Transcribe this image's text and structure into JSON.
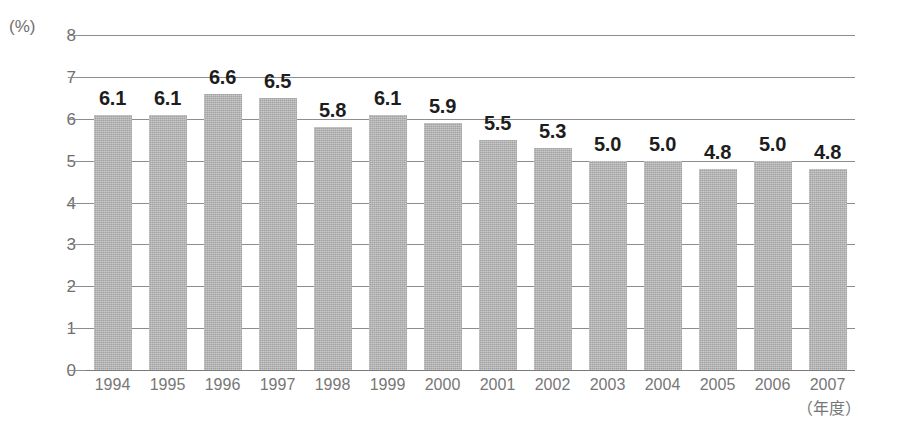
{
  "chart_data": {
    "type": "bar",
    "title": "",
    "subtitle": "",
    "xlabel": "（年度）",
    "ylabel": "(%)",
    "ylim": [
      0,
      8
    ],
    "ytick_step": 1,
    "grid": true,
    "legend": "none",
    "bar_color": "#b3b3b3",
    "label_color": "#1d1d1d",
    "axis_text_color": "#777777",
    "gridline_color": "#8d8d8d",
    "background": "#ffffff",
    "categories": [
      "1994",
      "1995",
      "1996",
      "1997",
      "1998",
      "1999",
      "2000",
      "2001",
      "2002",
      "2003",
      "2004",
      "2005",
      "2006",
      "2007"
    ],
    "values": [
      6.1,
      6.1,
      6.6,
      6.5,
      5.8,
      6.1,
      5.9,
      5.5,
      5.3,
      5.0,
      5.0,
      4.8,
      5.0,
      4.8
    ],
    "value_labels": [
      "6.1",
      "6.1",
      "6.6",
      "6.5",
      "5.8",
      "6.1",
      "5.9",
      "5.5",
      "5.3",
      "5.0",
      "5.0",
      "4.8",
      "5.0",
      "4.8"
    ],
    "ytick_labels": [
      "8",
      "7",
      "6",
      "5",
      "4",
      "3",
      "2",
      "1",
      "0"
    ],
    "ytick_values": [
      8,
      7,
      6,
      5,
      4,
      3,
      2,
      1,
      0
    ]
  }
}
